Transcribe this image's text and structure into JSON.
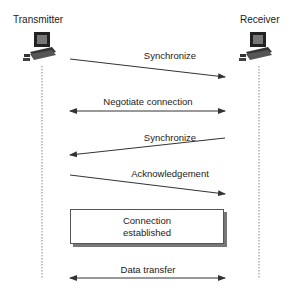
{
  "actors": {
    "left": {
      "label": "Transmitter",
      "icon": "computer-icon"
    },
    "right": {
      "label": "Receiver",
      "icon": "computer-icon"
    }
  },
  "messages": [
    {
      "label": "Synchronize",
      "direction": "left-to-right"
    },
    {
      "label": "Negotiate connection",
      "direction": "bidirectional"
    },
    {
      "label": "Synchronize",
      "direction": "right-to-left"
    },
    {
      "label": "Acknowledgement",
      "direction": "left-to-right"
    },
    {
      "label": "Data transfer",
      "direction": "bidirectional"
    }
  ],
  "state_box": {
    "line1": "Connection",
    "line2": "established"
  },
  "colors": {
    "line": "#333333",
    "lifeline": "#888888",
    "shadow": "#777777"
  }
}
